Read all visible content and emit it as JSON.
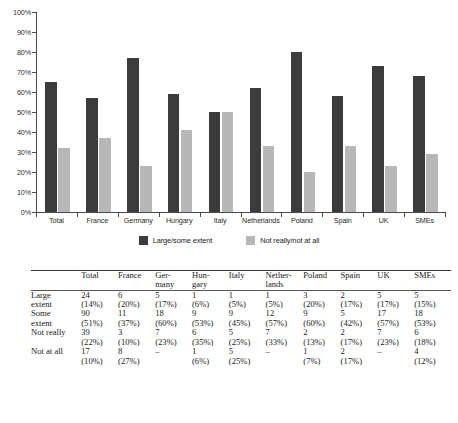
{
  "chart_data": {
    "type": "bar",
    "title": "",
    "subtitle": "",
    "xlabel": "",
    "ylabel": "",
    "ylim": [
      0,
      100
    ],
    "ytick_labels": [
      "100%",
      "90%",
      "80%",
      "70%",
      "60%",
      "50%",
      "40%",
      "30%",
      "20%",
      "10%",
      "0%"
    ],
    "ytick_values": [
      100,
      90,
      80,
      70,
      60,
      50,
      40,
      30,
      20,
      10,
      0
    ],
    "grid": false,
    "legend_position": "bottom",
    "categories": [
      "Total",
      "France",
      "Germany",
      "Hungary",
      "Italy",
      "Netherlands",
      "Poland",
      "Spain",
      "UK",
      "SMEs"
    ],
    "series": [
      {
        "name": "Large/some extent",
        "color": "#3b3b3b",
        "values": [
          65,
          57,
          77,
          59,
          50,
          62,
          80,
          58,
          73,
          68
        ]
      },
      {
        "name": "Not really/not at all",
        "color": "#b7b7b7",
        "values": [
          32,
          37,
          23,
          41,
          50,
          33,
          20,
          33,
          23,
          29
        ]
      }
    ]
  },
  "legend": {
    "items": [
      {
        "label": "Large/some extent",
        "swatch": "dark-swatch"
      },
      {
        "label": "Not really/not at all",
        "swatch": "light-swatch"
      }
    ]
  },
  "table": {
    "corner": "",
    "columns": [
      {
        "line1": "Total",
        "line2": ""
      },
      {
        "line1": "France",
        "line2": ""
      },
      {
        "line1": "Ger-",
        "line2": "many"
      },
      {
        "line1": "Hun-",
        "line2": "gary"
      },
      {
        "line1": "Italy",
        "line2": ""
      },
      {
        "line1": "Nether-",
        "line2": "lands"
      },
      {
        "line1": "Poland",
        "line2": ""
      },
      {
        "line1": "Spain",
        "line2": ""
      },
      {
        "line1": "UK",
        "line2": ""
      },
      {
        "line1": "SMEs",
        "line2": ""
      }
    ],
    "rows": [
      {
        "label1": "Large",
        "label2": "extent",
        "counts": [
          "24",
          "6",
          "5",
          "1",
          "1",
          "1",
          "3",
          "2",
          "5",
          "5"
        ],
        "percents": [
          "(14%)",
          "(20%)",
          "(17%)",
          "(6%)",
          "(5%)",
          "(5%)",
          "(20%)",
          "(17%)",
          "(17%)",
          "(15%)"
        ]
      },
      {
        "label1": "Some",
        "label2": "extent",
        "counts": [
          "90",
          "11",
          "18",
          "9",
          "9",
          "12",
          "9",
          "5",
          "17",
          "18"
        ],
        "percents": [
          "(51%)",
          "(37%)",
          "(60%)",
          "(53%)",
          "(45%)",
          "(57%)",
          "(60%)",
          "(42%)",
          "(57%)",
          "(53%)"
        ]
      },
      {
        "label1": "Not really",
        "label2": "",
        "counts": [
          "39",
          "3",
          "7",
          "6",
          "5",
          "7",
          "2",
          "2",
          "7",
          "6"
        ],
        "percents": [
          "(22%)",
          "(10%)",
          "(23%)",
          "(35%)",
          "(25%)",
          "(33%)",
          "(13%)",
          "(17%)",
          "(23%)",
          "(18%)"
        ]
      },
      {
        "label1": "Not at all",
        "label2": "",
        "counts": [
          "17",
          "8",
          "–",
          "1",
          "5",
          "–",
          "1",
          "2",
          "–",
          "4"
        ],
        "percents": [
          "(10%)",
          "(27%)",
          "",
          "(6%)",
          "(25%)",
          "",
          "(7%)",
          "(17%)",
          "",
          "(12%)"
        ]
      }
    ]
  }
}
